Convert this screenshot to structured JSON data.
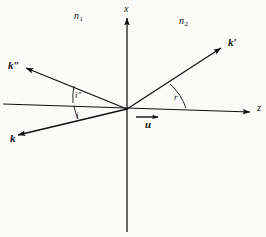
{
  "figure": {
    "width": 266,
    "height": 237,
    "background": "#fbfbfa",
    "ink": "#111111"
  },
  "axes": {
    "x_label": "x",
    "z_label": "z",
    "origin": {
      "x": 127,
      "y": 109
    },
    "vertical": {
      "x": 127,
      "top": 16,
      "bottom": 232
    },
    "horizontal": {
      "left_x": 3,
      "left_y": 104,
      "right_x": 252,
      "right_y": 112
    }
  },
  "media": {
    "left": {
      "symbol": "n",
      "subscript": "1"
    },
    "right": {
      "symbol": "n",
      "subscript": "2"
    }
  },
  "rays": [
    {
      "name": "incident-wavevector",
      "label": "k",
      "prime": "",
      "from": {
        "x": 12,
        "y": 137
      },
      "to": {
        "x": 127,
        "y": 109
      },
      "arrow_at": "start",
      "label_pos": {
        "x": 10,
        "y": 133
      }
    },
    {
      "name": "reflected-wavevector",
      "label": "k",
      "prime": "″",
      "from": {
        "x": 127,
        "y": 109
      },
      "to": {
        "x": 22,
        "y": 66
      },
      "arrow_at": "end",
      "label_pos": {
        "x": 8,
        "y": 60
      }
    },
    {
      "name": "refracted-wavevector",
      "label": "k",
      "prime": "′",
      "from": {
        "x": 127,
        "y": 109
      },
      "to": {
        "x": 224,
        "y": 46
      },
      "arrow_at": "end",
      "label_pos": {
        "x": 228,
        "y": 37
      }
    }
  ],
  "angles": [
    {
      "name": "angle-of-incidence",
      "label": "i",
      "prime": "",
      "value_deg": 14,
      "label_pos": {
        "x": 76,
        "y": 111
      }
    },
    {
      "name": "angle-of-reflection",
      "label": "i",
      "prime": "″",
      "value_deg": 22,
      "label_pos": {
        "x": 75,
        "y": 91
      }
    },
    {
      "name": "angle-of-refraction",
      "label": "r",
      "prime": "",
      "value_deg": 33,
      "label_pos": {
        "x": 174,
        "y": 93
      }
    }
  ],
  "velocity": {
    "name": "interface-velocity",
    "label": "u",
    "arrow": {
      "x1": 136,
      "y1": 117,
      "x2": 160,
      "y2": 117
    },
    "label_pos": {
      "x": 145,
      "y": 119
    }
  }
}
